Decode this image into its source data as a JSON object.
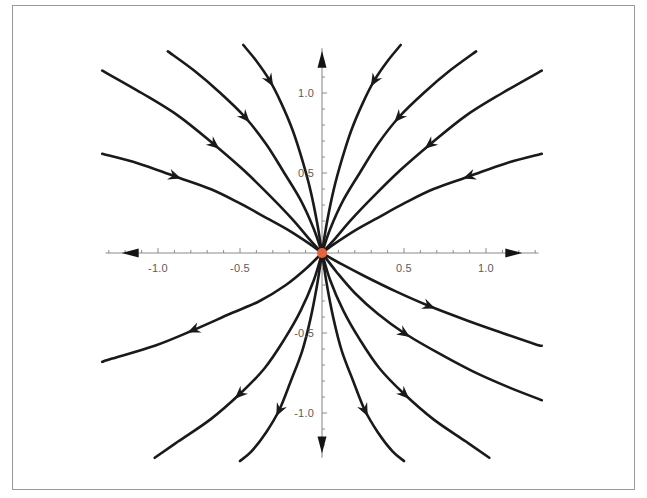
{
  "figure": {
    "kind": "phase-portrait",
    "title": "",
    "background_color": "#ffffff",
    "frame_color": "#9a9a9e",
    "curve_color": "#1a1a1a",
    "axis_color": "#8c8c90",
    "tick_label_color": "#5b5b5f",
    "equilibrium_color": "#e8643c"
  },
  "axes": {
    "x": {
      "label": "",
      "range": [
        -1.32,
        1.32
      ],
      "major_ticks": [
        -1.0,
        -0.5,
        0.5,
        1.0
      ],
      "major_tick_labels": [
        "-1.0",
        "-0.5",
        "0.5",
        "1.0"
      ],
      "minor_tick_step": 0.1,
      "arrow_direction": "both"
    },
    "y": {
      "label": "",
      "range": [
        -1.28,
        1.28
      ],
      "major_ticks": [
        -1.0,
        -0.5,
        0.5,
        1.0
      ],
      "major_tick_labels": [
        "-1.0",
        "-0.5",
        "0.5",
        "1.0"
      ],
      "minor_tick_step": 0.1,
      "arrow_direction": "both"
    }
  },
  "equilibrium_points": [
    {
      "name": "origin",
      "x": 0,
      "y": 0,
      "color": "#e8643c",
      "radius_px": 5
    }
  ],
  "chart_data": {
    "type": "line",
    "title": "",
    "xlabel": "",
    "ylabel": "",
    "xlim": [
      -1.32,
      1.32
    ],
    "ylim": [
      -1.28,
      1.28
    ],
    "grid": false,
    "legend": null,
    "series": [
      {
        "name": "upper-left-outer",
        "flow": "inward",
        "arrow_at": {
          "x": -0.75,
          "y": 0.78
        },
        "points": [
          [
            -1.34,
            1.14
          ],
          [
            -1.1,
            1.0
          ],
          [
            -0.88,
            0.86
          ],
          [
            -0.66,
            0.68
          ],
          [
            -0.48,
            0.52
          ],
          [
            -0.32,
            0.36
          ],
          [
            -0.18,
            0.21
          ],
          [
            -0.08,
            0.09
          ],
          [
            0,
            0
          ]
        ]
      },
      {
        "name": "upper-left-mid",
        "flow": "inward",
        "arrow_at": {
          "x": -0.47,
          "y": 0.94
        },
        "points": [
          [
            -0.94,
            1.26
          ],
          [
            -0.78,
            1.14
          ],
          [
            -0.62,
            1.0
          ],
          [
            -0.47,
            0.85
          ],
          [
            -0.34,
            0.68
          ],
          [
            -0.23,
            0.5
          ],
          [
            -0.13,
            0.33
          ],
          [
            -0.05,
            0.15
          ],
          [
            0,
            0
          ]
        ]
      },
      {
        "name": "upper-left-inner",
        "flow": "inward",
        "arrow_at": {
          "x": -0.27,
          "y": 1.02
        },
        "points": [
          [
            -0.48,
            1.3
          ],
          [
            -0.4,
            1.2
          ],
          [
            -0.32,
            1.08
          ],
          [
            -0.25,
            0.94
          ],
          [
            -0.18,
            0.77
          ],
          [
            -0.12,
            0.58
          ],
          [
            -0.07,
            0.39
          ],
          [
            -0.03,
            0.19
          ],
          [
            0,
            0
          ]
        ]
      },
      {
        "name": "upper-left-flat",
        "flow": "inward",
        "arrow_at": {
          "x": -0.82,
          "y": 0.42
        },
        "points": [
          [
            -1.34,
            0.62
          ],
          [
            -1.12,
            0.56
          ],
          [
            -0.9,
            0.48
          ],
          [
            -0.68,
            0.4
          ],
          [
            -0.5,
            0.31
          ],
          [
            -0.34,
            0.22
          ],
          [
            -0.2,
            0.14
          ],
          [
            -0.08,
            0.06
          ],
          [
            0,
            0
          ]
        ]
      },
      {
        "name": "upper-right-inner",
        "flow": "inward",
        "arrow_at": {
          "x": 0.27,
          "y": 1.02
        },
        "points": [
          [
            0.48,
            1.3
          ],
          [
            0.4,
            1.2
          ],
          [
            0.32,
            1.08
          ],
          [
            0.25,
            0.94
          ],
          [
            0.18,
            0.77
          ],
          [
            0.12,
            0.58
          ],
          [
            0.07,
            0.39
          ],
          [
            0.03,
            0.19
          ],
          [
            0,
            0
          ]
        ]
      },
      {
        "name": "upper-right-mid",
        "flow": "inward",
        "arrow_at": {
          "x": 0.47,
          "y": 0.94
        },
        "points": [
          [
            0.94,
            1.26
          ],
          [
            0.78,
            1.14
          ],
          [
            0.62,
            1.0
          ],
          [
            0.47,
            0.85
          ],
          [
            0.34,
            0.68
          ],
          [
            0.23,
            0.5
          ],
          [
            0.13,
            0.33
          ],
          [
            0.05,
            0.15
          ],
          [
            0,
            0
          ]
        ]
      },
      {
        "name": "upper-right-outer",
        "flow": "inward",
        "arrow_at": {
          "x": 0.75,
          "y": 0.78
        },
        "points": [
          [
            1.34,
            1.14
          ],
          [
            1.1,
            1.0
          ],
          [
            0.88,
            0.86
          ],
          [
            0.66,
            0.68
          ],
          [
            0.48,
            0.52
          ],
          [
            0.32,
            0.36
          ],
          [
            0.18,
            0.21
          ],
          [
            0.08,
            0.09
          ],
          [
            0,
            0
          ]
        ]
      },
      {
        "name": "upper-right-flat",
        "flow": "inward",
        "arrow_at": {
          "x": 0.82,
          "y": 0.42
        },
        "points": [
          [
            1.34,
            0.62
          ],
          [
            1.12,
            0.56
          ],
          [
            0.9,
            0.48
          ],
          [
            0.68,
            0.4
          ],
          [
            0.5,
            0.31
          ],
          [
            0.34,
            0.22
          ],
          [
            0.2,
            0.14
          ],
          [
            0.08,
            0.06
          ],
          [
            0,
            0
          ]
        ]
      },
      {
        "name": "lower-left-flat",
        "flow": "outward",
        "arrow_at": {
          "x": -0.72,
          "y": -0.48
        },
        "points": [
          [
            0,
            0
          ],
          [
            -0.1,
            -0.1
          ],
          [
            -0.22,
            -0.2
          ],
          [
            -0.38,
            -0.3
          ],
          [
            -0.56,
            -0.38
          ],
          [
            -0.78,
            -0.48
          ],
          [
            -1.02,
            -0.58
          ],
          [
            -1.28,
            -0.66
          ],
          [
            -1.34,
            -0.68
          ]
        ]
      },
      {
        "name": "lower-left-mid",
        "flow": "outward",
        "arrow_at": {
          "x": -0.6,
          "y": -0.88
        },
        "points": [
          [
            0,
            0
          ],
          [
            -0.05,
            -0.17
          ],
          [
            -0.13,
            -0.36
          ],
          [
            -0.23,
            -0.54
          ],
          [
            -0.35,
            -0.72
          ],
          [
            -0.5,
            -0.88
          ],
          [
            -0.68,
            -1.04
          ],
          [
            -0.88,
            -1.18
          ],
          [
            -1.02,
            -1.28
          ]
        ]
      },
      {
        "name": "lower-left-inner",
        "flow": "outward",
        "arrow_at": {
          "x": -0.3,
          "y": -0.92
        },
        "points": [
          [
            0,
            0
          ],
          [
            -0.03,
            -0.2
          ],
          [
            -0.07,
            -0.41
          ],
          [
            -0.12,
            -0.61
          ],
          [
            -0.19,
            -0.8
          ],
          [
            -0.26,
            -0.98
          ],
          [
            -0.34,
            -1.12
          ],
          [
            -0.43,
            -1.24
          ],
          [
            -0.5,
            -1.3
          ]
        ]
      },
      {
        "name": "lower-right-inner",
        "flow": "outward",
        "arrow_at": {
          "x": 0.3,
          "y": -0.92
        },
        "points": [
          [
            0,
            0
          ],
          [
            0.03,
            -0.2
          ],
          [
            0.07,
            -0.41
          ],
          [
            0.12,
            -0.61
          ],
          [
            0.19,
            -0.8
          ],
          [
            0.26,
            -0.98
          ],
          [
            0.34,
            -1.12
          ],
          [
            0.43,
            -1.24
          ],
          [
            0.5,
            -1.3
          ]
        ]
      },
      {
        "name": "lower-right-mid",
        "flow": "outward",
        "arrow_at": {
          "x": 0.58,
          "y": -0.86
        },
        "points": [
          [
            0,
            0
          ],
          [
            0.05,
            -0.17
          ],
          [
            0.13,
            -0.36
          ],
          [
            0.23,
            -0.54
          ],
          [
            0.35,
            -0.72
          ],
          [
            0.5,
            -0.88
          ],
          [
            0.68,
            -1.04
          ],
          [
            0.88,
            -1.18
          ],
          [
            1.02,
            -1.28
          ]
        ]
      },
      {
        "name": "lower-right-outer",
        "flow": "outward",
        "arrow_at": {
          "x": 0.52,
          "y": -0.5
        },
        "points": [
          [
            0,
            0
          ],
          [
            0.09,
            -0.12
          ],
          [
            0.2,
            -0.25
          ],
          [
            0.34,
            -0.38
          ],
          [
            0.5,
            -0.5
          ],
          [
            0.7,
            -0.62
          ],
          [
            0.92,
            -0.74
          ],
          [
            1.14,
            -0.84
          ],
          [
            1.34,
            -0.92
          ]
        ]
      },
      {
        "name": "lower-right-flat",
        "flow": "outward",
        "arrow_at": {
          "x": 0.74,
          "y": -0.4
        },
        "points": [
          [
            0,
            0
          ],
          [
            0.12,
            -0.07
          ],
          [
            0.27,
            -0.15
          ],
          [
            0.45,
            -0.24
          ],
          [
            0.65,
            -0.33
          ],
          [
            0.88,
            -0.42
          ],
          [
            1.1,
            -0.5
          ],
          [
            1.3,
            -0.57
          ],
          [
            1.34,
            -0.58
          ]
        ]
      }
    ]
  }
}
